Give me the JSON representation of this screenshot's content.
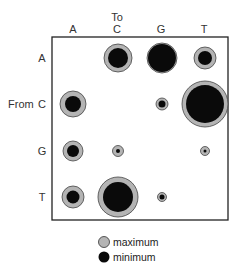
{
  "chart_data": {
    "type": "bubble-matrix",
    "title": "",
    "x_axis_title": "To",
    "y_axis_title": "From",
    "columns": [
      "A",
      "C",
      "G",
      "T"
    ],
    "rows": [
      "A",
      "C",
      "G",
      "T"
    ],
    "legend": [
      {
        "label": "maximum",
        "color": "#b4b4b4"
      },
      {
        "label": "minimum",
        "color": "#0a0a0a"
      }
    ],
    "cells": [
      {
        "from": "A",
        "to": "C",
        "maximum_r": 14,
        "minimum_r": 10
      },
      {
        "from": "A",
        "to": "G",
        "maximum_r": 15,
        "minimum_r": 14
      },
      {
        "from": "A",
        "to": "T",
        "maximum_r": 11,
        "minimum_r": 7
      },
      {
        "from": "C",
        "to": "A",
        "maximum_r": 13,
        "minimum_r": 8
      },
      {
        "from": "C",
        "to": "G",
        "maximum_r": 6,
        "minimum_r": 3.5
      },
      {
        "from": "C",
        "to": "T",
        "maximum_r": 23,
        "minimum_r": 19
      },
      {
        "from": "G",
        "to": "A",
        "maximum_r": 10,
        "minimum_r": 6
      },
      {
        "from": "G",
        "to": "C",
        "maximum_r": 5.5,
        "minimum_r": 2
      },
      {
        "from": "G",
        "to": "T",
        "maximum_r": 4.5,
        "minimum_r": 1.5
      },
      {
        "from": "T",
        "to": "A",
        "maximum_r": 11,
        "minimum_r": 6.5
      },
      {
        "from": "T",
        "to": "C",
        "maximum_r": 20,
        "minimum_r": 15
      },
      {
        "from": "T",
        "to": "G",
        "maximum_r": 4.5,
        "minimum_r": 2.5
      }
    ],
    "grid": false,
    "legend_position": "bottom"
  },
  "labels": {
    "to": "To",
    "from": "From",
    "col_A": "A",
    "col_C": "C",
    "col_G": "G",
    "col_T": "T",
    "row_A": "A",
    "row_C": "C",
    "row_G": "G",
    "row_T": "T",
    "legend_max": "maximum",
    "legend_min": "minimum"
  }
}
